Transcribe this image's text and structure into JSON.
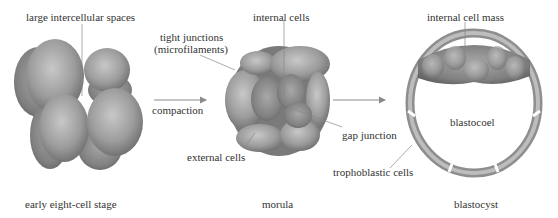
{
  "labels": {
    "stage1": {
      "callout": "large intercellular spaces",
      "caption": "early eight-cell stage"
    },
    "transition1": {
      "label": "compaction"
    },
    "stage2": {
      "callout_tight_1": "tight junctions",
      "callout_tight_2": "(microfilaments)",
      "callout_internal": "internal cells",
      "callout_external": "external cells",
      "callout_gap": "gap junction",
      "caption": "morula"
    },
    "stage3": {
      "callout_icm": "internal cell mass",
      "callout_blastocoel": "blastocoel",
      "callout_tropho": "trophoblastic cells",
      "caption": "blastocyst"
    }
  },
  "colors": {
    "text": "#333333",
    "leader_line": "#888888",
    "arrow": "#8a8a8a",
    "cell_fill": "#9a9a9a",
    "cell_highlight": "#c4c4c4",
    "cell_shadow": "#6e6e6e",
    "background": "#ffffff"
  }
}
